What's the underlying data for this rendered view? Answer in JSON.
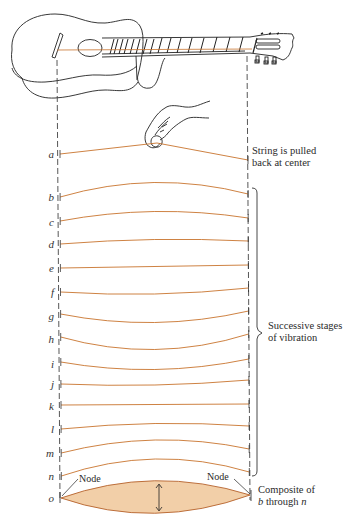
{
  "figure": {
    "string_color": "#c8742e",
    "composite_fill": "#f2cfa8",
    "composite_stroke": "#b5612a",
    "ink_color": "#222222",
    "dash_color": "#444444",
    "left_x": 58,
    "right_x": 248
  },
  "annotations": {
    "pulled": {
      "line1": "String is pulled",
      "line2": "back at center"
    },
    "stages": {
      "line1": "Successive stages",
      "line2": "of vibration"
    },
    "composite": {
      "line1": "Composite of",
      "line2_pre": "b",
      "line2_mid": " through ",
      "line2_post": "n"
    },
    "node_left": "Node",
    "node_right": "Node"
  },
  "rows": [
    {
      "label": "a",
      "y": 153,
      "left_y": 154,
      "right_y": 160,
      "peak": -14,
      "note": "plucked"
    },
    {
      "label": "b",
      "y": 196,
      "left_y": 197,
      "right_y": 194,
      "peak": -13
    },
    {
      "label": "c",
      "y": 221,
      "left_y": 221,
      "right_y": 218,
      "peak": -8
    },
    {
      "label": "d",
      "y": 243,
      "left_y": 244,
      "right_y": 241,
      "peak": -3
    },
    {
      "label": "e",
      "y": 267,
      "left_y": 268,
      "right_y": 265,
      "peak": 0
    },
    {
      "label": "f",
      "y": 291,
      "left_y": 292,
      "right_y": 288,
      "peak": 4
    },
    {
      "label": "g",
      "y": 315,
      "left_y": 314,
      "right_y": 311,
      "peak": 10
    },
    {
      "label": "h",
      "y": 338,
      "left_y": 337,
      "right_y": 334,
      "peak": 14
    },
    {
      "label": "i",
      "y": 363,
      "left_y": 362,
      "right_y": 359,
      "peak": 9
    },
    {
      "label": "j",
      "y": 383,
      "left_y": 384,
      "right_y": 380,
      "peak": 3
    },
    {
      "label": "k",
      "y": 405,
      "left_y": 405,
      "right_y": 404,
      "peak": 0
    },
    {
      "label": "l",
      "y": 428,
      "left_y": 429,
      "right_y": 426,
      "peak": -4
    },
    {
      "label": "m",
      "y": 452,
      "left_y": 453,
      "right_y": 449,
      "peak": -11
    },
    {
      "label": "n",
      "y": 475,
      "left_y": 476,
      "right_y": 472,
      "peak": -15
    },
    {
      "label": "o",
      "y": 497,
      "left_y": 498,
      "right_y": 495,
      "peak": 0,
      "note": "composite"
    }
  ]
}
